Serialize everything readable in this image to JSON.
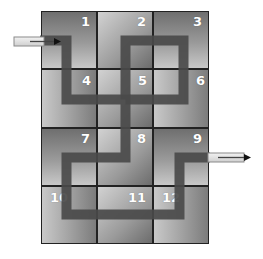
{
  "diagram": {
    "type": "tile-maze",
    "grid": {
      "cols": 3,
      "rows": 4,
      "x0": 41,
      "y0": 11,
      "cell_w": 56,
      "cell_h": 58.25
    },
    "tiles": [
      {
        "label": "1",
        "col": 0,
        "row": 0,
        "shade": "a"
      },
      {
        "label": "2",
        "col": 1,
        "row": 0,
        "shade": "b"
      },
      {
        "label": "3",
        "col": 2,
        "row": 0,
        "shade": "a"
      },
      {
        "label": "4",
        "col": 0,
        "row": 1,
        "shade": "b"
      },
      {
        "label": "5",
        "col": 1,
        "row": 1,
        "shade": "a"
      },
      {
        "label": "6",
        "col": 2,
        "row": 1,
        "shade": "b"
      },
      {
        "label": "7",
        "col": 0,
        "row": 2,
        "shade": "a"
      },
      {
        "label": "8",
        "col": 1,
        "row": 2,
        "shade": "b"
      },
      {
        "label": "9",
        "col": 2,
        "row": 2,
        "shade": "a"
      },
      {
        "label": "10",
        "col": 0,
        "row": 3,
        "shade": "b"
      },
      {
        "label": "11",
        "col": 1,
        "row": 3,
        "shade": "a"
      },
      {
        "label": "12",
        "col": 2,
        "row": 3,
        "shade": "b"
      }
    ],
    "entry_arrow": {
      "label": "entry-arrow",
      "direction": "right"
    },
    "exit_arrow": {
      "label": "exit-arrow",
      "direction": "right"
    },
    "path_color": "#4a4a4a",
    "grid_line_color": "#222222"
  }
}
